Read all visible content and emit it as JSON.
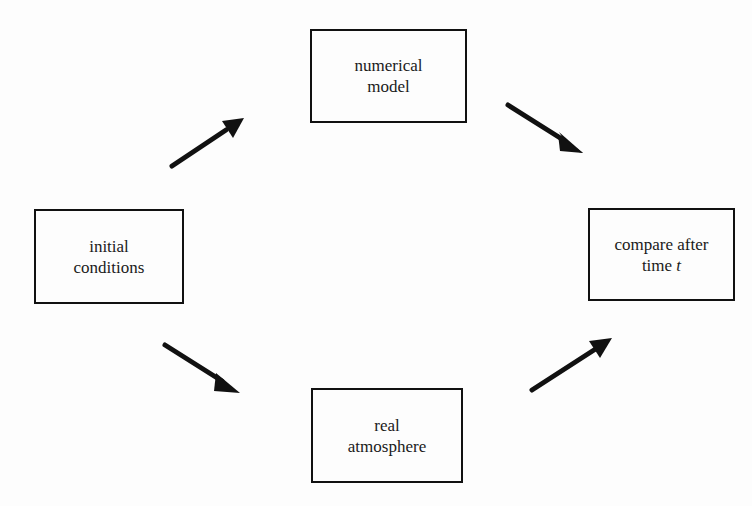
{
  "diagram": {
    "type": "flow",
    "nodes": [
      {
        "id": "initial",
        "lines": [
          "initial",
          "conditions"
        ]
      },
      {
        "id": "model",
        "lines": [
          "numerical",
          "model"
        ]
      },
      {
        "id": "atmosphere",
        "lines": [
          "real",
          "atmosphere"
        ]
      },
      {
        "id": "compare",
        "lines": [
          "compare after",
          "time "
        ],
        "italic_suffix": "t"
      }
    ],
    "edges": [
      {
        "from": "initial",
        "to": "model"
      },
      {
        "from": "model",
        "to": "compare"
      },
      {
        "from": "initial",
        "to": "atmosphere"
      },
      {
        "from": "atmosphere",
        "to": "compare"
      }
    ],
    "colors": {
      "stroke": "#111111",
      "background": "#fdfdfd"
    }
  }
}
